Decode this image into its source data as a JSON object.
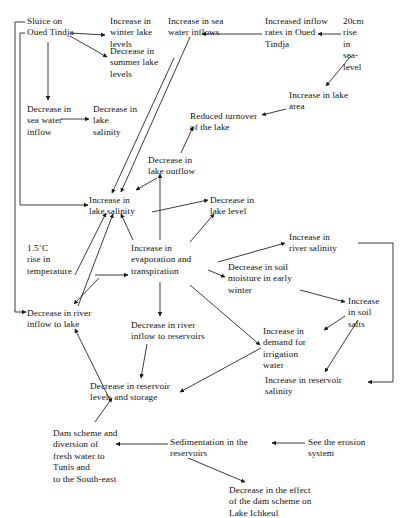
{
  "diagram": {
    "type": "causal-loop-diagram",
    "stroke_color": "#1a1a1a",
    "text_color": "#111111",
    "background": "#ffffff",
    "width": 401,
    "height": 518,
    "nodes": [
      {
        "id": "sluice",
        "label": "Sluice on\nOued Tindja",
        "x": 27,
        "y": 16,
        "w": 78
      },
      {
        "id": "winter_lake",
        "label": "Increase in\nwinter lake\nlevels",
        "x": 110,
        "y": 16,
        "w": 58
      },
      {
        "id": "summer_lake",
        "label": "Decrease in\nsummer lake\nlevels",
        "x": 110,
        "y": 46,
        "w": 62
      },
      {
        "id": "sea_water_inflows",
        "label": "Increase in sea\nwater inflows",
        "x": 168,
        "y": 16,
        "w": 80
      },
      {
        "id": "inflow_rates",
        "label": "Increased inflow\nrates in Oued\nTindja",
        "x": 265,
        "y": 16,
        "w": 82
      },
      {
        "id": "sea_level",
        "label": "20cm\nrise\nin\nsea-\nlevel",
        "x": 343,
        "y": 16,
        "w": 40
      },
      {
        "id": "lake_area",
        "label": "Increase in lake\narea",
        "x": 289,
        "y": 90,
        "w": 80
      },
      {
        "id": "dec_sea_inflow",
        "label": "Decrease in\nsea water\ninflow",
        "x": 27,
        "y": 104,
        "w": 62
      },
      {
        "id": "dec_lake_salinity",
        "label": "Decrease in\nlake\nsalinity",
        "x": 93,
        "y": 104,
        "w": 58
      },
      {
        "id": "reduced_turnover",
        "label": "Reduced turnover\nof the lake",
        "x": 190,
        "y": 111,
        "w": 90
      },
      {
        "id": "lake_outflow",
        "label": "Decrease in\nlake outflow",
        "x": 148,
        "y": 155,
        "w": 62
      },
      {
        "id": "inc_lake_salinity",
        "label": "Increase in\nlake salinity",
        "x": 89,
        "y": 195,
        "w": 62
      },
      {
        "id": "lake_level",
        "label": "Decrease in\nlake level",
        "x": 210,
        "y": 195,
        "w": 62
      },
      {
        "id": "temperature",
        "label": "1.5˚C\nrise in\ntemperature",
        "x": 27,
        "y": 243,
        "w": 66
      },
      {
        "id": "evaporation",
        "label": "Increase in\nevaporation and\ntranspiration",
        "x": 131,
        "y": 243,
        "w": 84
      },
      {
        "id": "river_salinity",
        "label": "Increase in\nriver salinity",
        "x": 289,
        "y": 232,
        "w": 66
      },
      {
        "id": "soil_moisture",
        "label": "Decrease in soil\nmoisture in early\nwinter",
        "x": 228,
        "y": 262,
        "w": 88
      },
      {
        "id": "soil_salts",
        "label": "Increase\nin soil\nsalts",
        "x": 348,
        "y": 296,
        "w": 46
      },
      {
        "id": "dec_river_lake",
        "label": "Decrease in river\ninflow to lake",
        "x": 27,
        "y": 308,
        "w": 90
      },
      {
        "id": "dec_river_res",
        "label": "Decrease in river\ninflow to reservoirs",
        "x": 131,
        "y": 320,
        "w": 96
      },
      {
        "id": "irrigation",
        "label": "Increase in\ndemand for\nirrigation\nwater",
        "x": 263,
        "y": 326,
        "w": 62
      },
      {
        "id": "reservoir_salinity",
        "label": "Increase in reservoir\nsalinity",
        "x": 265,
        "y": 375,
        "w": 104
      },
      {
        "id": "reservoir_levels",
        "label": "Decrease in reservoir\nlevels and storage",
        "x": 90,
        "y": 381,
        "w": 112
      },
      {
        "id": "dam_scheme",
        "label": "Dam scheme and\ndiversion of\nfresh  water to\nTunis and\nto the South-east",
        "x": 53,
        "y": 428,
        "w": 84
      },
      {
        "id": "sedimentation",
        "label": "Sedimentation in the\nreservoirs",
        "x": 170,
        "y": 437,
        "w": 100
      },
      {
        "id": "erosion",
        "label": "See the erosion\nsystem",
        "x": 308,
        "y": 437,
        "w": 78
      },
      {
        "id": "dam_effect",
        "label": "Decrease in the effect\nof the dam scheme on\nLake Ichkeul",
        "x": 229,
        "y": 485,
        "w": 116
      }
    ],
    "edges": [
      {
        "from": "sluice",
        "to": "winter_lake",
        "path": "M 70 33 L 105 35"
      },
      {
        "from": "sluice",
        "to": "summer_lake",
        "path": "M 70 36 L 107 57"
      },
      {
        "from": "sluice",
        "to": "dec_sea_inflow",
        "path": "M 48 42 L 48 100"
      },
      {
        "from": "dec_sea_inflow",
        "to": "dec_lake_salinity",
        "path": "M 61 119 L 89 119"
      },
      {
        "from": "inflow_rates",
        "to": "sea_water_inflows",
        "path": "M 262 34 L 202 34"
      },
      {
        "from": "sea_level",
        "to": "inflow_rates",
        "path": "M 341 34 L 318 34"
      },
      {
        "from": "sea_level",
        "to": "lake_area",
        "path": "M 351 56 L 326 86"
      },
      {
        "from": "lake_area",
        "to": "reduced_turnover",
        "path": "M 286 109 L 262 115"
      },
      {
        "from": "summer_lake",
        "to": "inc_lake_salinity",
        "path": "M 174 58 L 112 193"
      },
      {
        "from": "sea_water_inflows",
        "to": "inc_lake_salinity",
        "path": "M 190 37 L 121 192"
      },
      {
        "from": "lake_outflow",
        "to": "inc_lake_salinity",
        "path": "M 157 178 L 136 190"
      },
      {
        "from": "lake_outflow",
        "to": "reduced_turnover",
        "path": "M 181 153 L 193 127"
      },
      {
        "from": "evaporation",
        "to": "lake_outflow",
        "path": "M 160 240 L 160 174"
      },
      {
        "from": "evaporation",
        "to": "inc_lake_salinity",
        "path": "M 133 240 L 121 214"
      },
      {
        "from": "temperature",
        "to": "inc_lake_salinity",
        "path": "M 75 275 L 106 213"
      },
      {
        "from": "dec_river_lake",
        "to": "inc_lake_salinity",
        "path": "M 78 306 L 113 214"
      },
      {
        "from": "inc_lake_salinity",
        "to": "lake_level",
        "path": "M 152 212 L 208 200"
      },
      {
        "from": "evaporation",
        "to": "lake_level",
        "path": "M 190 242 L 214 214"
      },
      {
        "from": "temperature",
        "to": "evaporation",
        "path": "M 95 275 L 128 275"
      },
      {
        "from": "temperature",
        "to": "dec_river_lake",
        "path": "M 99 278 L 74 304"
      },
      {
        "from": "evaporation",
        "to": "river_salinity",
        "path": "M 218 262 L 285 243"
      },
      {
        "from": "evaporation",
        "to": "soil_moisture",
        "path": "M 208 270 L 225 277"
      },
      {
        "from": "evaporation",
        "to": "irrigation",
        "path": "M 190 285 L 260 345"
      },
      {
        "from": "evaporation",
        "to": "dec_river_res",
        "path": "M 160 282 L 160 316"
      },
      {
        "from": "soil_moisture",
        "to": "soil_salts",
        "path": "M 300 290 L 345 302"
      },
      {
        "from": "soil_salts",
        "to": "irrigation",
        "path": "M 345 316 L 324 330"
      },
      {
        "from": "soil_salts",
        "to": "reservoir_salinity",
        "path": "M 358 320 L 325 372"
      },
      {
        "from": "irrigation",
        "to": "reservoir_levels",
        "path": "M 261 348 L 180 392"
      },
      {
        "from": "dec_river_res",
        "to": "reservoir_levels",
        "path": "M 147 344 L 141 378"
      },
      {
        "from": "dec_river_lake",
        "to": "reservoir_levels",
        "path": "M 110 400 L 75 329"
      },
      {
        "from": "dam_scheme",
        "to": "reservoir_levels",
        "path": "M 95 422 L 112 398"
      },
      {
        "from": "sedimentation",
        "to": "dam_scheme",
        "path": "M 168 444 L 116 444"
      },
      {
        "from": "erosion",
        "to": "sedimentation",
        "path": "M 305 443 L 272 443"
      },
      {
        "from": "sedimentation",
        "to": "dam_effect",
        "path": "M 188 458 L 245 482"
      },
      {
        "from": "loop_left_outer",
        "to": "sluice",
        "path": "M 15 312 L 15 22 L 25 22"
      },
      {
        "from": "loop_left_inner",
        "to": "sluice",
        "path": "M 20 205 L 20 33 L 25 33"
      },
      {
        "from": "dec_river_lake",
        "to": "loop_left_outer",
        "path": "M 15 312 L 26 312"
      },
      {
        "from": "inc_lake_salinity",
        "to": "loop_left_inner",
        "path": "M 20 205 L 88 205"
      },
      {
        "from": "river_salinity",
        "to": "reservoir_salinity",
        "path": "M 358 243 L 393 243 L 393 382 L 368 382"
      }
    ]
  }
}
